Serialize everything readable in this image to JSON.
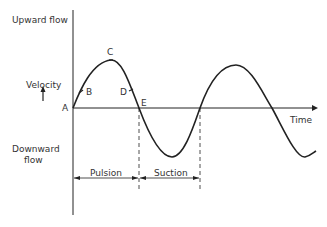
{
  "diagram": {
    "y_labels": {
      "upward": "Upward flow",
      "velocity": "Velocity",
      "downward_line1": "Downward",
      "downward_line2": "flow"
    },
    "x_label": "Time",
    "points": {
      "A": "A",
      "B": "B",
      "C": "C",
      "D": "D",
      "E": "E"
    },
    "phases": {
      "pulsion": "Pulsion",
      "suction": "Suction"
    },
    "colors": {
      "line": "#222222",
      "background": "#ffffff"
    }
  }
}
